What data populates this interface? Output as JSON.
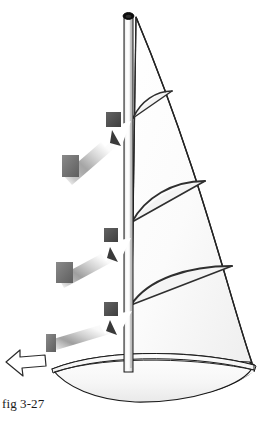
{
  "figure": {
    "caption": "fig 3-27",
    "colors": {
      "background": "#ffffff",
      "outline": "#1a1a1a",
      "sail_fill": "#fcfcfc",
      "sail_shade": "#f2f2f2",
      "hull_fill": "#f7f7f7",
      "hull_keel": "#000000",
      "mast_light": "#ffffff",
      "mast_mid": "#e8e8e8",
      "mast_dark": "#9a9a9a",
      "mast_cap": "#101010",
      "arrow_body_light": "#ffffff",
      "arrow_body_gray": "#9b9b9b",
      "arrow_head_square": "#555555",
      "arrow_tail_square": "#6f6f6f",
      "arrow_shadow": "#3c3c3c",
      "wind_arrow_outline": "#2b2b2b",
      "wind_arrow_fill": "#ffffff"
    },
    "mast": {
      "label": "mast",
      "x_left": 124,
      "x_right": 133,
      "y_top": 14,
      "y_bottom": 372
    },
    "sail": {
      "label": "mainsail",
      "head": {
        "x": 137,
        "y": 16
      },
      "tack": {
        "x": 131,
        "y": 356
      },
      "clew": {
        "x": 253,
        "y": 364
      },
      "draft_stripes": [
        {
          "name": "upper-draft-stripe",
          "mast_y": 118,
          "leech_x": 172,
          "leech_y": 91,
          "camber": 14
        },
        {
          "name": "middle-draft-stripe",
          "mast_y": 222,
          "leech_x": 205,
          "leech_y": 181,
          "camber": 18
        },
        {
          "name": "lower-draft-stripe",
          "mast_y": 305,
          "leech_x": 232,
          "leech_y": 266,
          "camber": 21
        }
      ]
    },
    "boom": {
      "label": "boom",
      "y": 360,
      "x_from": 128,
      "x_to": 250
    },
    "hull": {
      "label": "hull",
      "bow": {
        "x": 52,
        "y": 369
      },
      "stern": {
        "x": 254,
        "y": 366
      },
      "deck_y": 372,
      "keel_depth_y": 408
    },
    "wind_arrows": [
      {
        "name": "upper-wind-arrow",
        "tip": {
          "x": 130,
          "y": 122
        },
        "tail": {
          "x": 62,
          "y": 178
        },
        "angle_deg": -39,
        "head_square": {
          "x": 106,
          "y": 112,
          "size": 15
        },
        "tail_square": {
          "x": 62,
          "y": 155,
          "w": 17,
          "h": 22
        }
      },
      {
        "name": "middle-wind-arrow",
        "tip": {
          "x": 130,
          "y": 239
        },
        "tail": {
          "x": 56,
          "y": 280
        },
        "angle_deg": -29,
        "head_square": {
          "x": 104,
          "y": 228,
          "size": 14
        },
        "tail_square": {
          "x": 56,
          "y": 262,
          "w": 17,
          "h": 21
        }
      },
      {
        "name": "lower-wind-arrow",
        "tip": {
          "x": 131,
          "y": 312
        },
        "tail": {
          "x": 48,
          "y": 342
        },
        "angle_deg": -20,
        "head_square": {
          "x": 104,
          "y": 302,
          "size": 14
        },
        "tail_square": {
          "x": 46,
          "y": 334,
          "w": 10,
          "h": 18
        }
      }
    ],
    "direction_arrow": {
      "name": "boat-heading-arrow",
      "points_to": "left",
      "x": 5,
      "y": 349,
      "width": 42,
      "height": 28
    }
  }
}
